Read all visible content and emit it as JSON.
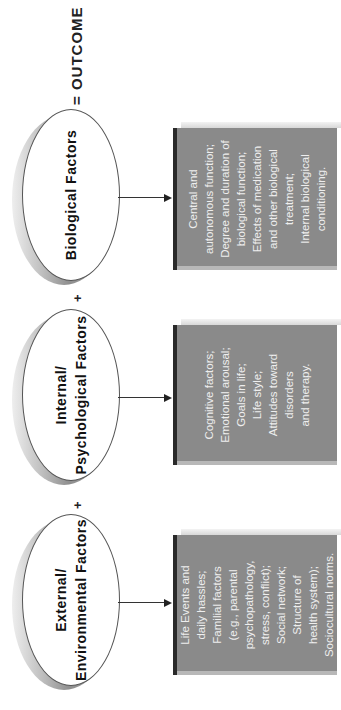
{
  "diagram": {
    "factors": [
      {
        "title": "External/\nEnvironmental Factors",
        "title_line1": "External/",
        "title_line2": "Environmental Factors",
        "details": "Life Events and\ndaily hassles;\nFamilial factors\n(e.g., parental\npsychopathology,\nstress, conflict);\nSocial network;\nStructure of\nhealth system);\nSociocultural norms."
      },
      {
        "title_line1": "Internal/",
        "title_line2": "Psychological Factors",
        "details": "Cognitive factors;\nEmotional arousal;\nGoals in life;\nLife style;\nAttitudes toward\ndisorders\nand therapy."
      },
      {
        "title_line1": "",
        "title_line2": "Biological Factors",
        "details": "Central and\nautonomous function;\nDegree and duration of\nbiological function;\nEffects of medication\nand other biological\ntreatment;\nInternal biological\nconditioning."
      }
    ],
    "operators": {
      "plus1": "+",
      "plus2": "+",
      "outcome": "= OUTCOME"
    },
    "colors": {
      "box_fill": "#8a8a8a",
      "box_edge": "#2a2a2a",
      "ellipse_rim": "#8f8f8f",
      "text": "#111111"
    }
  }
}
